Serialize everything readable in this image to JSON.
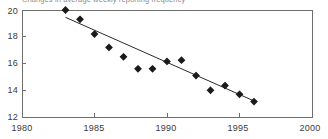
{
  "chart_data": {
    "type": "scatter",
    "title": "Changes in average weekly reporting frequency",
    "xlabel": "",
    "ylabel": "",
    "xlim": [
      1980,
      2000
    ],
    "ylim": [
      12,
      20
    ],
    "xticks": [
      "1980",
      "1985",
      "1990",
      "1995",
      "2000"
    ],
    "yticks": [
      "12",
      "14",
      "16",
      "18",
      "20"
    ],
    "grid": false,
    "legend": null,
    "x": [
      1983,
      1984,
      1985,
      1986,
      1987,
      1988,
      1989,
      1990,
      1991,
      1992,
      1993,
      1994,
      1995,
      1996
    ],
    "values": [
      20.0,
      19.3,
      18.2,
      17.2,
      16.5,
      15.6,
      15.6,
      16.15,
      16.25,
      15.1,
      14.0,
      14.35,
      13.7,
      13.15
    ],
    "series": [
      {
        "name": "Average weekly reporting frequency",
        "marker": "diamond",
        "color": "#1a1a1a",
        "values": [
          20.0,
          19.3,
          18.2,
          17.2,
          16.5,
          15.6,
          15.6,
          16.15,
          16.25,
          15.1,
          14.0,
          14.35,
          13.7,
          13.15
        ]
      }
    ],
    "trendline": {
      "type": "linear-fit",
      "color": "#2b2b2b",
      "x": [
        1983,
        1996
      ],
      "y": [
        19.45,
        13.2
      ]
    }
  },
  "axes": {
    "y_tick_values": [
      12,
      14,
      16,
      18,
      20
    ],
    "x_tick_values": [
      1980,
      1985,
      1990,
      1995,
      2000
    ]
  },
  "colors": {
    "marker": "#1a1a1a",
    "line": "#2b2b2b",
    "frame": "#6e6e6e",
    "tick_text": "#3a3a3a",
    "title_text": "#8c8c8c",
    "background": "#ffffff"
  }
}
